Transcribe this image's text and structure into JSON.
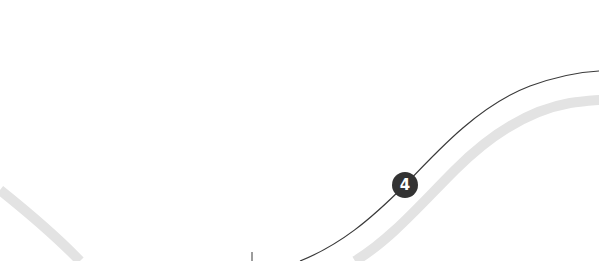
{
  "diagram": {
    "background": "#ffffff",
    "route_line": {
      "color": "#3a3a3a",
      "width": 1.2,
      "path": "M 300 261 C 340 245, 370 220, 405 185 C 440 148, 480 105, 530 86 C 555 77, 580 72, 599 71"
    },
    "band": {
      "color": "#e3e3e3",
      "width": 10,
      "path_right": "M 355 261 C 390 240, 420 205, 455 170 C 490 135, 530 110, 570 103 C 585 101, 595 100, 599 100",
      "path_left": "M 0 190 C 25 210, 55 235, 80 261"
    },
    "tick": {
      "color": "#3a3a3a",
      "x": 252,
      "y1": 252,
      "y2": 261
    },
    "marker": {
      "label": "4",
      "x": 405,
      "y": 185,
      "fill": "#333333",
      "text_color": "#ffffff"
    }
  }
}
